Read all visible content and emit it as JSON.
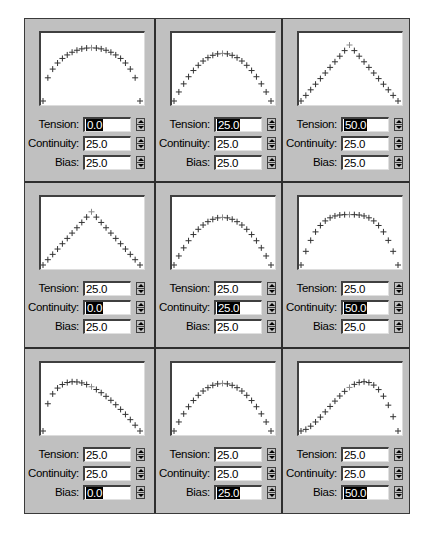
{
  "labels": {
    "tension": "Tension:",
    "continuity": "Continuity:",
    "bias": "Bias:"
  },
  "colors": {
    "panel_bg": "#c0c0c0",
    "plot_bg": "#ffffff",
    "marker": "#333333",
    "key_marker": "#888888",
    "selection": "#000000"
  },
  "panels": [
    {
      "tension": "0.0",
      "continuity": "25.0",
      "bias": "25.0",
      "selected": "tension",
      "shape": "round-arc"
    },
    {
      "tension": "25.0",
      "continuity": "25.0",
      "bias": "25.0",
      "selected": "tension",
      "shape": "parabola"
    },
    {
      "tension": "50.0",
      "continuity": "25.0",
      "bias": "25.0",
      "selected": "tension",
      "shape": "sharp-peak"
    },
    {
      "tension": "25.0",
      "continuity": "0.0",
      "bias": "25.0",
      "selected": "continuity",
      "shape": "triangle"
    },
    {
      "tension": "25.0",
      "continuity": "25.0",
      "bias": "25.0",
      "selected": "continuity",
      "shape": "parabola"
    },
    {
      "tension": "25.0",
      "continuity": "50.0",
      "bias": "25.0",
      "selected": "continuity",
      "shape": "flat-top"
    },
    {
      "tension": "25.0",
      "continuity": "25.0",
      "bias": "0.0",
      "selected": "bias",
      "shape": "skew-left"
    },
    {
      "tension": "25.0",
      "continuity": "25.0",
      "bias": "25.0",
      "selected": "bias",
      "shape": "parabola"
    },
    {
      "tension": "25.0",
      "continuity": "25.0",
      "bias": "50.0",
      "selected": "bias",
      "shape": "skew-right"
    }
  ]
}
